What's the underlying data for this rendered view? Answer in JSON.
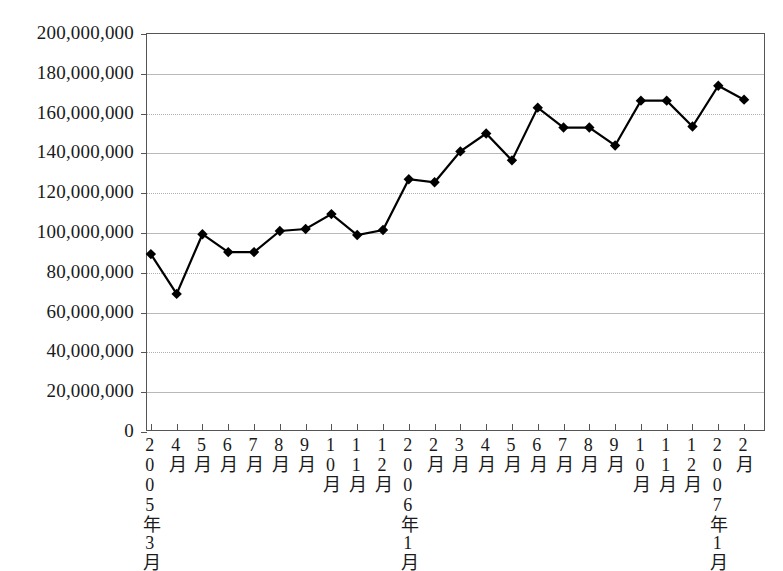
{
  "chart_data": {
    "type": "line",
    "title": "",
    "subtitle": "",
    "xlabel": "",
    "ylabel": "",
    "ylim": [
      0,
      200000000
    ],
    "ytick_step": 20000000,
    "ytick_labels": [
      "200,000,000",
      "180,000,000",
      "160,000,000",
      "140,000,000",
      "120,000,000",
      "100,000,000",
      "80,000,000",
      "60,000,000",
      "40,000,000",
      "20,000,000",
      "0"
    ],
    "ytick_values": [
      200000000,
      180000000,
      160000000,
      140000000,
      120000000,
      100000000,
      80000000,
      60000000,
      40000000,
      20000000,
      0
    ],
    "categories": [
      "2005年3月",
      "4月",
      "5月",
      "6月",
      "7月",
      "8月",
      "9月",
      "10月",
      "11月",
      "12月",
      "2006年1月",
      "2月",
      "3月",
      "4月",
      "5月",
      "6月",
      "7月",
      "8月",
      "9月",
      "10月",
      "11月",
      "12月",
      "2007年1月",
      "2月"
    ],
    "values": [
      89400000,
      69400000,
      99400000,
      90400000,
      90400000,
      101000000,
      102000000,
      109500000,
      99000000,
      101500000,
      127000000,
      125500000,
      141000000,
      150000000,
      136500000,
      163000000,
      153000000,
      153000000,
      144000000,
      166500000,
      166500000,
      153500000,
      174000000,
      167000000
    ],
    "legend": [],
    "legend_position": "none",
    "grid": true,
    "marker": "diamond",
    "line_color": "#000000",
    "marker_color": "#000000",
    "grid_color": "#b9b9b9",
    "axis_color": "#555555"
  }
}
